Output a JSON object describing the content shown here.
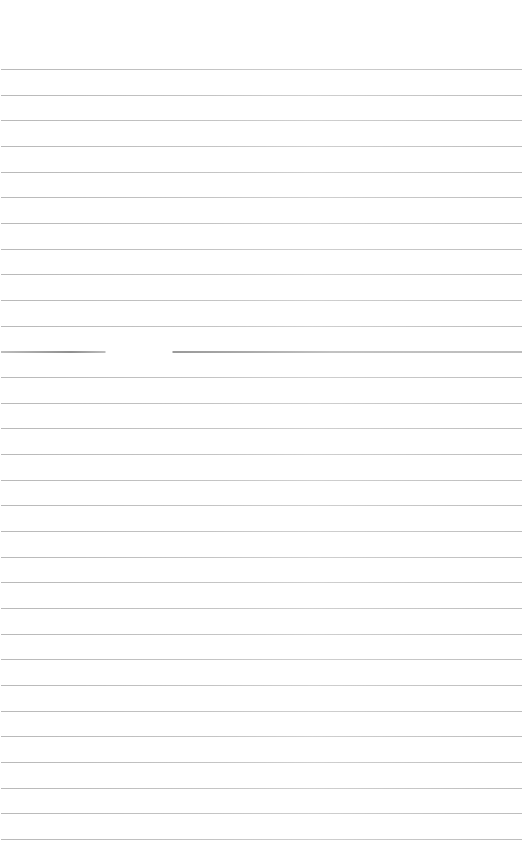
{
  "page": {
    "type": "lined-paper",
    "background": "#ffffff",
    "line_color": "#c0c0c0",
    "line_count": 31,
    "first_line_y": 69,
    "line_spacing": 25.67,
    "content_text": "",
    "special_lines": [
      {
        "index": 11,
        "note": "gap in rule",
        "gap_x_start": 105,
        "gap_x_end": 172
      }
    ]
  }
}
